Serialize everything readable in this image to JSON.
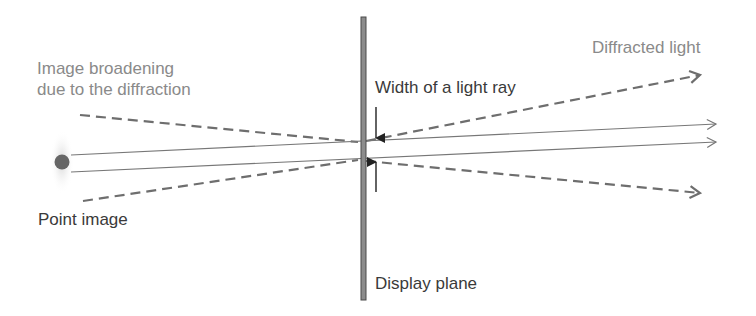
{
  "labels": {
    "image_broadening_line1": "Image broadening",
    "image_broadening_line2": "due to the diffraction",
    "point_image": "Point image",
    "width_of_light_ray": "Width of a light ray",
    "display_plane": "Display plane",
    "diffracted_light": "Diffracted light"
  },
  "colors": {
    "gray_text": "#8a8a8a",
    "dark_text": "#3a3a3a",
    "dashed_line": "#6e6e6e",
    "solid_ray": "#777777",
    "display_plane_fill": "#8c8c8c",
    "display_plane_border": "#4a4a4a",
    "point_image": "#666666"
  }
}
